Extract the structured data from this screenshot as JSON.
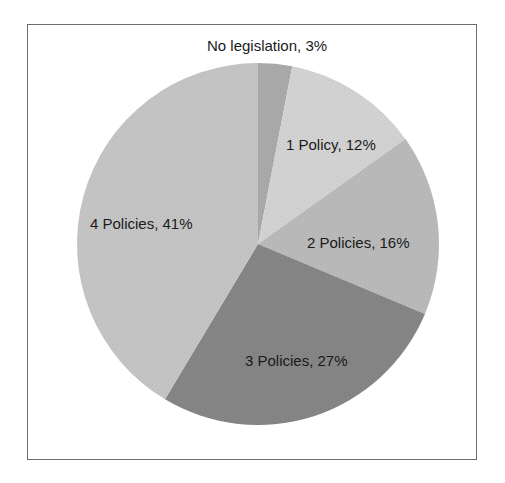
{
  "chart_data": {
    "type": "pie",
    "title": "",
    "categories": [
      "No legislation",
      "1 Policy",
      "2 Policies",
      "3 Policies",
      "4 Policies"
    ],
    "values": [
      3,
      12,
      16,
      27,
      41
    ],
    "unit": "%",
    "labels": [
      "No legislation, 3%",
      "1 Policy, 12%",
      "2 Policies, 16%",
      "3 Policies, 27%",
      "4 Policies, 41%"
    ],
    "colors": [
      "#a9a9a9",
      "#d2d2d2",
      "#b9b9b9",
      "#858585",
      "#c4c4c4"
    ],
    "start_angle_deg_from_top": 0,
    "direction": "clockwise",
    "legend": "none",
    "data_labels": "inside, category name and percentage"
  }
}
